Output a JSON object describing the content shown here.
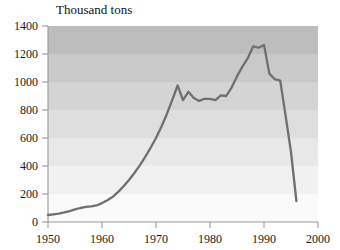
{
  "chart_data": {
    "type": "line",
    "title": "Thousand tons",
    "xlabel": "",
    "ylabel": "Thousand tons",
    "xlim": [
      1950,
      2000
    ],
    "ylim": [
      0,
      1400
    ],
    "grid": false,
    "legend": "none",
    "x_ticks": [
      1950,
      1960,
      1970,
      1980,
      1990,
      2000
    ],
    "x_tick_labels": [
      "1950",
      "1960",
      "1970",
      "1980",
      "1990",
      "2000"
    ],
    "y_ticks": [
      0,
      200,
      400,
      600,
      800,
      1000,
      1200,
      1400
    ],
    "y_tick_labels": [
      "0",
      "200",
      "400",
      "600",
      "800",
      "1000",
      "1200",
      "1400"
    ],
    "series": [
      {
        "name": "Production",
        "color": "#6f6f6f",
        "x": [
          1950,
          1951,
          1952,
          1953,
          1954,
          1955,
          1956,
          1957,
          1958,
          1959,
          1960,
          1961,
          1962,
          1963,
          1964,
          1965,
          1966,
          1967,
          1968,
          1969,
          1970,
          1971,
          1972,
          1973,
          1974,
          1975,
          1976,
          1977,
          1978,
          1979,
          1980,
          1981,
          1982,
          1983,
          1984,
          1985,
          1986,
          1987,
          1988,
          1989,
          1990,
          1991,
          1992,
          1993,
          1994,
          1995,
          1996
        ],
        "values": [
          50,
          55,
          60,
          68,
          78,
          90,
          100,
          108,
          112,
          118,
          135,
          155,
          180,
          215,
          255,
          300,
          350,
          405,
          465,
          530,
          600,
          680,
          770,
          870,
          975,
          870,
          930,
          885,
          865,
          880,
          880,
          870,
          905,
          900,
          960,
          1040,
          1110,
          1170,
          1255,
          1245,
          1265,
          1060,
          1020,
          1010,
          760,
          500,
          150
        ]
      }
    ],
    "background_bands": [
      {
        "from": 1200,
        "to": 1400,
        "color": "#bdbdbd"
      },
      {
        "from": 1000,
        "to": 1200,
        "color": "#c9c9c9"
      },
      {
        "from": 800,
        "to": 1000,
        "color": "#d4d4d4"
      },
      {
        "from": 600,
        "to": 800,
        "color": "#dedede"
      },
      {
        "from": 400,
        "to": 600,
        "color": "#e8e8e8"
      },
      {
        "from": 200,
        "to": 400,
        "color": "#f1f1f1"
      },
      {
        "from": 0,
        "to": 200,
        "color": "#fafafa"
      }
    ]
  }
}
